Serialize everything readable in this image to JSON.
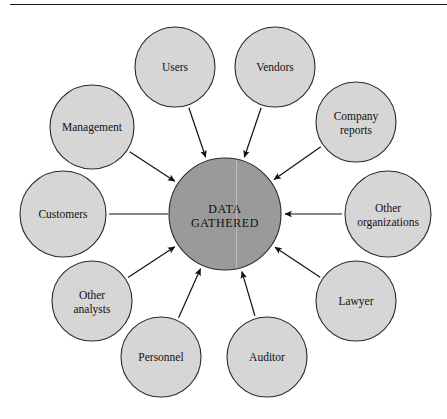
{
  "page": {
    "background_color": "#ffffff",
    "has_top_rule": true
  },
  "colors": {
    "outer_fill": "#d6d6d6",
    "outer_stroke": "#2b2b2b",
    "hub_fill": "#9a9a9a",
    "hub_stroke": "#2b2b2b",
    "arrow": "#111111",
    "text": "#111111"
  },
  "diagram": {
    "type": "radial-hub-and-spoke",
    "hub": {
      "name": "data-gathered",
      "line1": "DATA",
      "line2": "GATHERED",
      "cx": 225,
      "cy": 214,
      "r": 56
    },
    "nodes": [
      {
        "name": "users",
        "line1": "Users",
        "line2": "",
        "cx": 175,
        "cy": 67,
        "r": 40,
        "connector": "arrow"
      },
      {
        "name": "vendors",
        "line1": "Vendors",
        "line2": "",
        "cx": 275,
        "cy": 67,
        "r": 40,
        "connector": "arrow"
      },
      {
        "name": "company-reports",
        "line1": "Company",
        "line2": "reports",
        "cx": 356,
        "cy": 122,
        "r": 40,
        "connector": "arrow"
      },
      {
        "name": "other-organizations",
        "line1": "Other",
        "line2": "organizations",
        "cx": 388,
        "cy": 214,
        "r": 43,
        "connector": "arrow"
      },
      {
        "name": "lawyer",
        "line1": "Lawyer",
        "line2": "",
        "cx": 356,
        "cy": 301,
        "r": 40,
        "connector": "arrow"
      },
      {
        "name": "auditor",
        "line1": "Auditor",
        "line2": "",
        "cx": 267,
        "cy": 357,
        "r": 40,
        "connector": "arrow"
      },
      {
        "name": "personnel",
        "line1": "Personnel",
        "line2": "",
        "cx": 161,
        "cy": 357,
        "r": 40,
        "connector": "arrow"
      },
      {
        "name": "other-analysts",
        "line1": "Other",
        "line2": "analysts",
        "cx": 92,
        "cy": 301,
        "r": 40,
        "connector": "arrow"
      },
      {
        "name": "customers",
        "line1": "Customers",
        "line2": "",
        "cx": 63,
        "cy": 214,
        "r": 43,
        "connector": "plain-line"
      },
      {
        "name": "management",
        "line1": "Management",
        "line2": "",
        "cx": 92,
        "cy": 127,
        "r": 42,
        "connector": "arrow"
      }
    ]
  }
}
